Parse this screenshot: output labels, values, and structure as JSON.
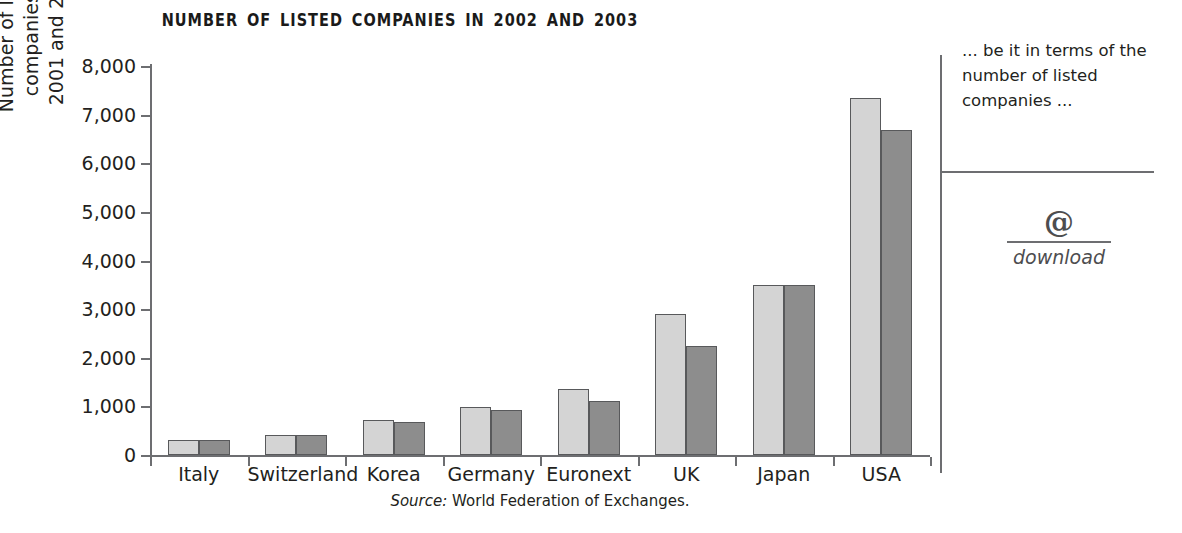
{
  "chart_data": {
    "type": "bar",
    "title": "NUMBER OF LISTED COMPANIES IN 2002 AND 2003",
    "xlabel": "",
    "ylabel": "Number of listed companies in 2001 and 2002",
    "ylabel_line1": "Number of listed companies in",
    "ylabel_line2": "2001 and 2002",
    "ylim": [
      0,
      8000
    ],
    "ytick_step": 1000,
    "ytick_labels": [
      "8,000",
      "7,000",
      "6,000",
      "5,000",
      "4,000",
      "3,000",
      "2,000",
      "1,000",
      "0"
    ],
    "ytick_values": [
      8000,
      7000,
      6000,
      5000,
      4000,
      3000,
      2000,
      1000,
      0
    ],
    "grid": false,
    "legend": "none",
    "categories": [
      "Italy",
      "Switzerland",
      "Korea",
      "Germany",
      "Euronext",
      "UK",
      "Japan",
      "USA"
    ],
    "series": [
      {
        "name": "2002",
        "color": "#d4d4d4",
        "values": [
          310,
          420,
          710,
          990,
          1360,
          2900,
          3490,
          7350
        ]
      },
      {
        "name": "2003",
        "color": "#8d8d8d",
        "values": [
          310,
          420,
          680,
          930,
          1120,
          2250,
          3490,
          6680
        ]
      }
    ],
    "source_label": "Source:",
    "source_text": "World Federation of Exchanges."
  },
  "sidebar": {
    "pullquote": "... be it in terms of the number of listed companies ...",
    "download_icon": "@",
    "download_label": "download"
  }
}
